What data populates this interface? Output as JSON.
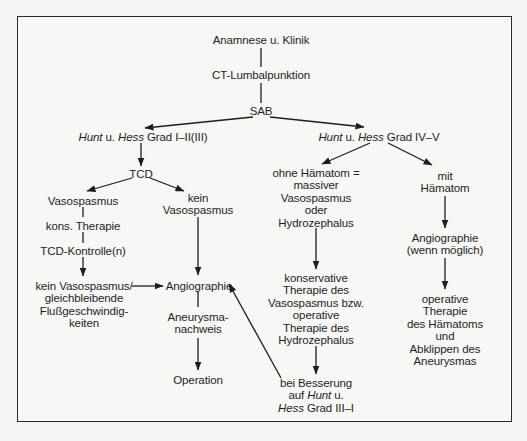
{
  "diagram": {
    "type": "flowchart",
    "nodes": {
      "anamnese": "Anamnese u. Klinik",
      "ct": "CT-Lumbalpunktion",
      "sab": "SAB",
      "hh_low": {
        "italic1": "Hunt",
        "mid": " u. ",
        "italic2": "Hess",
        "rest": " Grad I–II(III)"
      },
      "hh_high": {
        "italic1": "Hunt",
        "mid": " u. ",
        "italic2": "Hess",
        "rest": " Grad IV–V"
      },
      "tcd": "TCD",
      "vasospasmus": "Vasospasmus",
      "kein_vasospasmus": "kein\nVasospasmus",
      "kons_therapie": "kons. Therapie",
      "tcd_kontrolle": "TCD-Kontrolle(n)",
      "kein_vaso_gleich": "kein Vasospasmus/\ngleichbleibende\nFlußgeschwindig-\nkeiten",
      "angiographie": "Angiographie",
      "aneurysma_nachweis": "Aneurysma-\nnachweis",
      "operation": "Operation",
      "ohne_haematom": "ohne Hämatom =\nmassiver\nVasospasmus\noder\nHydrozephalus",
      "konservative": "konservative\nTherapie des\nVasospasmus bzw.\noperative\nTherapie des\nHydrozephalus",
      "bei_besserung": {
        "line1": "bei Besserung",
        "line2a": "auf ",
        "line2b": "Hunt",
        "line2c": " u.",
        "line3a": "Hess",
        "line3b": " Grad III–I"
      },
      "mit_haematom": "mit\nHämatom",
      "angiographie_moeglich": "Angiographie\n(wenn möglich)",
      "operative_haematom": "operative Therapie\ndes Hämatoms und\nAbklippen des\nAneurysmas"
    },
    "edges": [
      {
        "from": "anamnese",
        "to": "ct",
        "arrow": false
      },
      {
        "from": "ct",
        "to": "sab",
        "arrow": false
      },
      {
        "from": "sab",
        "to": "hh_low",
        "arrow": true
      },
      {
        "from": "sab",
        "to": "hh_high",
        "arrow": true
      },
      {
        "from": "hh_low",
        "to": "tcd",
        "arrow": true
      },
      {
        "from": "tcd",
        "to": "vasospasmus",
        "arrow": true
      },
      {
        "from": "tcd",
        "to": "kein_vasospasmus",
        "arrow": true
      },
      {
        "from": "vasospasmus",
        "to": "kons_therapie",
        "arrow": false
      },
      {
        "from": "kons_therapie",
        "to": "tcd_kontrolle",
        "arrow": false
      },
      {
        "from": "tcd_kontrolle",
        "to": "kein_vaso_gleich",
        "arrow": true
      },
      {
        "from": "kein_vaso_gleich",
        "to": "angiographie",
        "arrow": true
      },
      {
        "from": "kein_vasospasmus",
        "to": "angiographie",
        "arrow": true
      },
      {
        "from": "angiographie",
        "to": "aneurysma_nachweis",
        "arrow": false
      },
      {
        "from": "aneurysma_nachweis",
        "to": "operation",
        "arrow": true
      },
      {
        "from": "hh_high",
        "to": "ohne_haematom",
        "arrow": true
      },
      {
        "from": "hh_high",
        "to": "mit_haematom",
        "arrow": true
      },
      {
        "from": "ohne_haematom",
        "to": "konservative",
        "arrow": true
      },
      {
        "from": "konservative",
        "to": "bei_besserung",
        "arrow": true
      },
      {
        "from": "bei_besserung",
        "to": "angiographie",
        "arrow": true
      },
      {
        "from": "mit_haematom",
        "to": "angiographie_moeglich",
        "arrow": true
      },
      {
        "from": "angiographie_moeglich",
        "to": "operative_haematom",
        "arrow": true
      }
    ]
  }
}
